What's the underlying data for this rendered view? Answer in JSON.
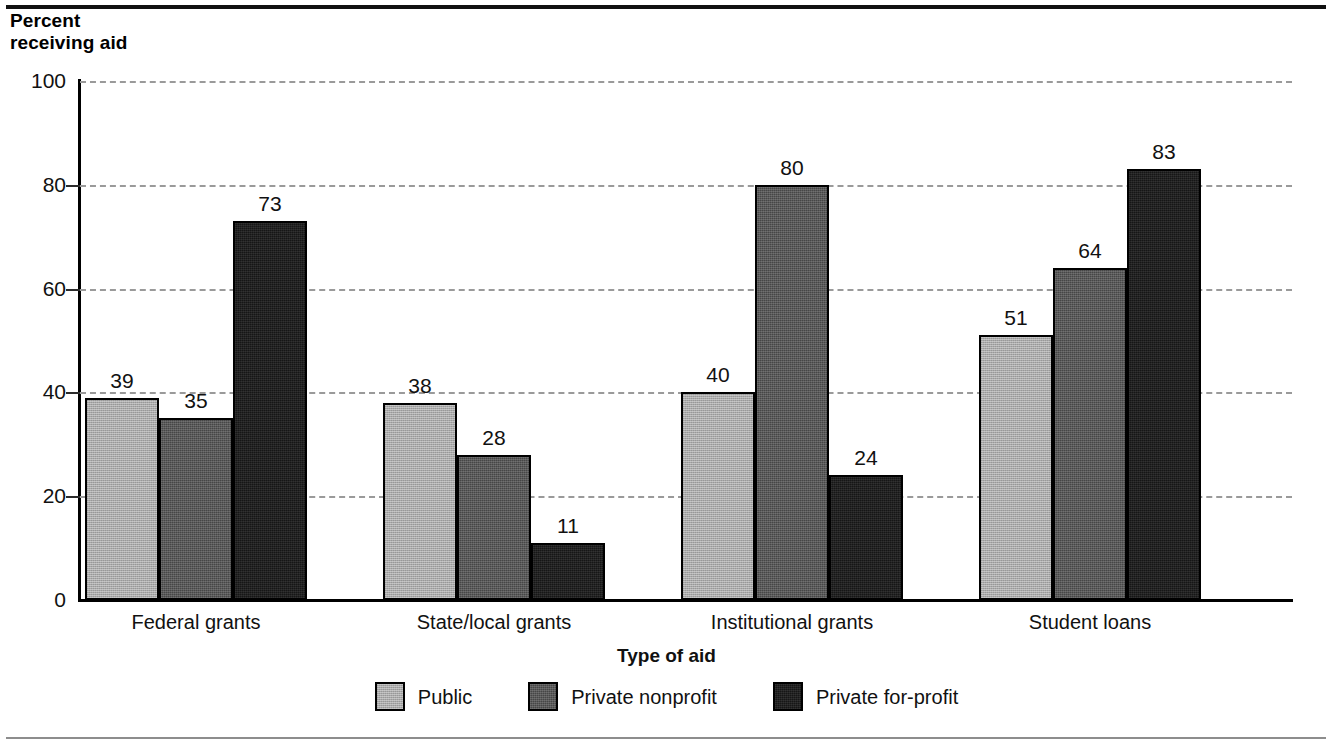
{
  "chart_data": {
    "type": "bar",
    "title": "",
    "subtitle": "",
    "ylabel": "Percent\nreceiving aid",
    "xlabel": "Type of aid",
    "categories": [
      "Federal grants",
      "State/local grants",
      "Institutional grants",
      "Student loans"
    ],
    "series": [
      {
        "name": "Public",
        "color": "#a9a9a9",
        "values": [
          39,
          38,
          40,
          51
        ]
      },
      {
        "name": "Private nonprofit",
        "color": "#464646",
        "values": [
          35,
          28,
          80,
          64
        ]
      },
      {
        "name": "Private for-profit",
        "color": "#161616",
        "values": [
          73,
          11,
          24,
          83
        ]
      }
    ],
    "ylim": [
      0,
      100
    ],
    "yticks": [
      0,
      20,
      40,
      60,
      80,
      100
    ],
    "ytick_labels": [
      "0",
      "20",
      "40",
      "60",
      "80",
      "100"
    ],
    "grid": "horizontal-dashed",
    "legend_position": "bottom",
    "value_labels": true
  },
  "axis": {
    "y_caption_line1": "Percent",
    "y_caption_line2": "receiving aid",
    "x_title": "Type of aid"
  },
  "legend": {
    "items": [
      {
        "label": "Public"
      },
      {
        "label": "Private nonprofit"
      },
      {
        "label": "Private for-profit"
      }
    ]
  }
}
